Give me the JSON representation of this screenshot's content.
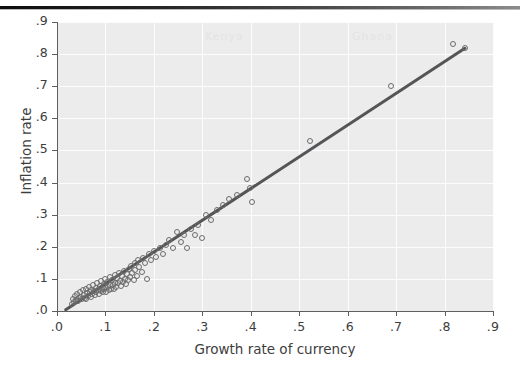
{
  "figure": {
    "background_color": "#ffffff",
    "rule_color": "#1a1a1a"
  },
  "bleed_through": [
    {
      "text": "Kenya",
      "x": 205,
      "y": 30
    },
    {
      "text": "Ghana",
      "x": 352,
      "y": 30
    }
  ],
  "chart_data": {
    "type": "scatter",
    "title": "",
    "subtitle": "",
    "xlabel": "Growth rate of currency",
    "ylabel": "Inflation rate",
    "xlim": [
      0.0,
      0.9
    ],
    "ylim": [
      0.0,
      0.9
    ],
    "xticks": [
      0.0,
      0.1,
      0.2,
      0.3,
      0.4,
      0.5,
      0.6,
      0.7,
      0.8,
      0.9
    ],
    "yticks": [
      0.0,
      0.1,
      0.2,
      0.3,
      0.4,
      0.5,
      0.6,
      0.7,
      0.8,
      0.9
    ],
    "xticklabels": [
      ".0",
      ".1",
      ".2",
      ".3",
      ".4",
      ".5",
      ".6",
      ".7",
      ".8",
      ".9"
    ],
    "yticklabels": [
      ".0",
      ".1",
      ".2",
      ".3",
      ".4",
      ".5",
      ".6",
      ".7",
      ".8",
      ".9"
    ],
    "grid": true,
    "grid_color": "#fdfdfd",
    "panel_color": "#ececed",
    "legend": null,
    "marker": {
      "style": "open-circle",
      "edge_color": "#6b6b6b",
      "fill": "none",
      "size": 6
    },
    "fit_line": {
      "name": "linear fit",
      "color": "#555557",
      "width": 3,
      "x_start": 0.018,
      "y_start": 0.004,
      "x_end": 0.842,
      "y_end": 0.818,
      "slope": 0.988,
      "intercept": -0.014
    },
    "series": [
      {
        "name": "countries",
        "points": [
          [
            0.03,
            0.022
          ],
          [
            0.034,
            0.036
          ],
          [
            0.036,
            0.028
          ],
          [
            0.038,
            0.046
          ],
          [
            0.04,
            0.034
          ],
          [
            0.042,
            0.052
          ],
          [
            0.044,
            0.03
          ],
          [
            0.046,
            0.04
          ],
          [
            0.048,
            0.058
          ],
          [
            0.05,
            0.044
          ],
          [
            0.052,
            0.036
          ],
          [
            0.054,
            0.064
          ],
          [
            0.056,
            0.05
          ],
          [
            0.058,
            0.042
          ],
          [
            0.06,
            0.07
          ],
          [
            0.06,
            0.038
          ],
          [
            0.062,
            0.056
          ],
          [
            0.064,
            0.048
          ],
          [
            0.066,
            0.076
          ],
          [
            0.068,
            0.06
          ],
          [
            0.07,
            0.044
          ],
          [
            0.07,
            0.066
          ],
          [
            0.072,
            0.054
          ],
          [
            0.074,
            0.082
          ],
          [
            0.076,
            0.062
          ],
          [
            0.078,
            0.05
          ],
          [
            0.08,
            0.072
          ],
          [
            0.08,
            0.058
          ],
          [
            0.082,
            0.088
          ],
          [
            0.084,
            0.066
          ],
          [
            0.086,
            0.054
          ],
          [
            0.088,
            0.078
          ],
          [
            0.09,
            0.062
          ],
          [
            0.09,
            0.094
          ],
          [
            0.092,
            0.07
          ],
          [
            0.094,
            0.058
          ],
          [
            0.096,
            0.084
          ],
          [
            0.098,
            0.068
          ],
          [
            0.1,
            0.1
          ],
          [
            0.1,
            0.074
          ],
          [
            0.102,
            0.06
          ],
          [
            0.104,
            0.09
          ],
          [
            0.106,
            0.076
          ],
          [
            0.108,
            0.064
          ],
          [
            0.11,
            0.106
          ],
          [
            0.11,
            0.082
          ],
          [
            0.112,
            0.07
          ],
          [
            0.114,
            0.096
          ],
          [
            0.116,
            0.08
          ],
          [
            0.118,
            0.068
          ],
          [
            0.12,
            0.112
          ],
          [
            0.12,
            0.088
          ],
          [
            0.122,
            0.074
          ],
          [
            0.124,
            0.102
          ],
          [
            0.126,
            0.086
          ],
          [
            0.128,
            0.118
          ],
          [
            0.13,
            0.094
          ],
          [
            0.132,
            0.078
          ],
          [
            0.134,
            0.108
          ],
          [
            0.136,
            0.09
          ],
          [
            0.138,
            0.124
          ],
          [
            0.14,
            0.1
          ],
          [
            0.142,
            0.084
          ],
          [
            0.144,
            0.114
          ],
          [
            0.146,
            0.096
          ],
          [
            0.148,
            0.13
          ],
          [
            0.15,
            0.106
          ],
          [
            0.152,
            0.14
          ],
          [
            0.155,
            0.118
          ],
          [
            0.158,
            0.098
          ],
          [
            0.16,
            0.15
          ],
          [
            0.162,
            0.128
          ],
          [
            0.165,
            0.11
          ],
          [
            0.168,
            0.158
          ],
          [
            0.17,
            0.136
          ],
          [
            0.175,
            0.12
          ],
          [
            0.178,
            0.166
          ],
          [
            0.182,
            0.148
          ],
          [
            0.186,
            0.1
          ],
          [
            0.19,
            0.176
          ],
          [
            0.195,
            0.158
          ],
          [
            0.2,
            0.186
          ],
          [
            0.205,
            0.168
          ],
          [
            0.212,
            0.196
          ],
          [
            0.218,
            0.178
          ],
          [
            0.225,
            0.206
          ],
          [
            0.232,
            0.222
          ],
          [
            0.24,
            0.196
          ],
          [
            0.248,
            0.246
          ],
          [
            0.256,
            0.216
          ],
          [
            0.262,
            0.236
          ],
          [
            0.268,
            0.196
          ],
          [
            0.276,
            0.256
          ],
          [
            0.284,
            0.238
          ],
          [
            0.292,
            0.268
          ],
          [
            0.3,
            0.228
          ],
          [
            0.308,
            0.3
          ],
          [
            0.318,
            0.282
          ],
          [
            0.33,
            0.316
          ],
          [
            0.342,
            0.33
          ],
          [
            0.356,
            0.348
          ],
          [
            0.372,
            0.362
          ],
          [
            0.392,
            0.41
          ],
          [
            0.398,
            0.384
          ],
          [
            0.402,
            0.34
          ],
          [
            0.522,
            0.53
          ],
          [
            0.69,
            0.7
          ],
          [
            0.818,
            0.832
          ],
          [
            0.842,
            0.818
          ]
        ]
      }
    ]
  }
}
